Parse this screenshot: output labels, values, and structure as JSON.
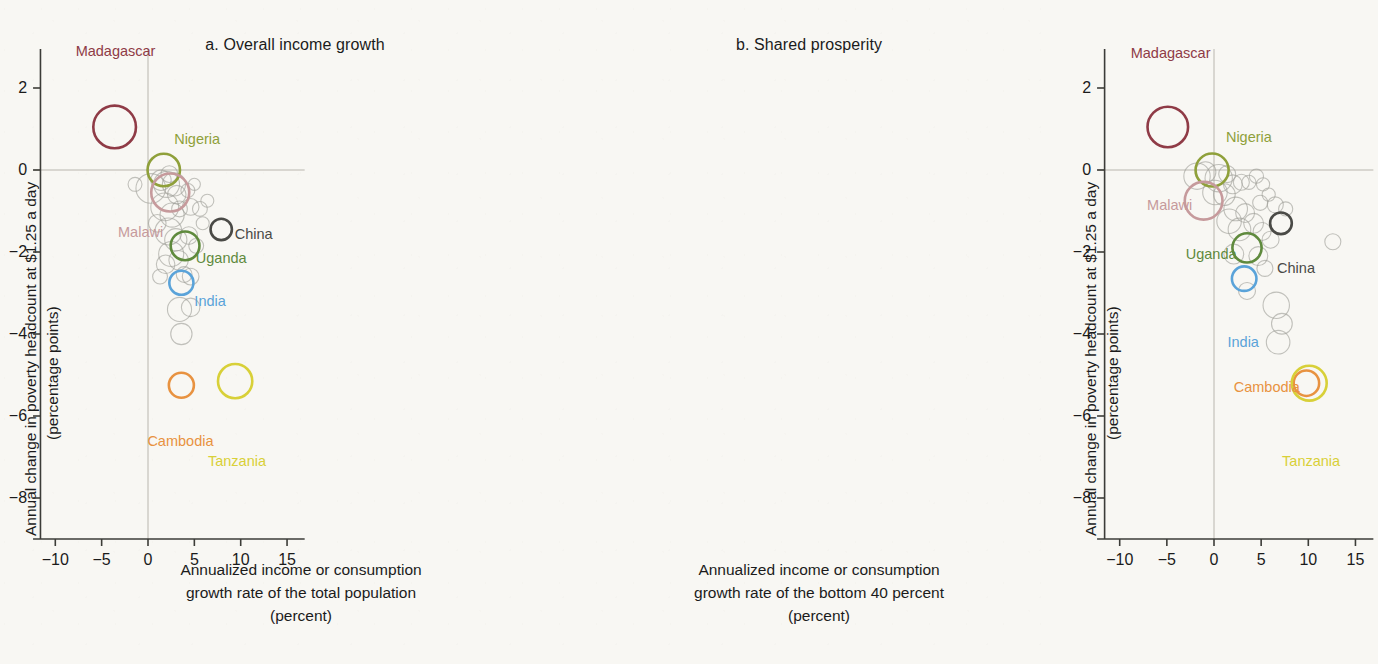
{
  "figure": {
    "background_color": "#f8f7f3",
    "ylabel_line1": "Annual change in poverty headcount at $1.25 a day",
    "ylabel_line2": "(percentage points)"
  },
  "panels": [
    {
      "key": "a",
      "title": "a. Overall income growth",
      "xlabel_line1": "Annualized income or consumption",
      "xlabel_line2": "growth rate of the total population",
      "xlabel_line3": "(percent)"
    },
    {
      "key": "b",
      "title": "b. Shared prosperity",
      "xlabel_line1": "Annualized income or consumption",
      "xlabel_line2": "growth rate of the bottom 40 percent",
      "xlabel_line3": "(percent)"
    }
  ],
  "chart_data": {
    "type": "scatter",
    "xlabel": "Annualized income or consumption growth rate (percent)",
    "ylabel": "Annual change in poverty headcount at $1.25 a day (percentage points)",
    "xlim": [
      -12.5,
      17.0
    ],
    "ylim": [
      -9.2,
      3.0
    ],
    "xticks": [
      -10,
      -5,
      0,
      5,
      10,
      15
    ],
    "xtick_labels": [
      "−10",
      "−5",
      "0",
      "5",
      "10",
      "15"
    ],
    "yticks": [
      2,
      0,
      -2,
      -4,
      -6,
      -8
    ],
    "ytick_labels": [
      "2",
      "0",
      "−2",
      "−4",
      "−6",
      "−8"
    ],
    "grid": false,
    "reference_lines": {
      "x": 0,
      "y": 0,
      "color": "#b9b6ae"
    },
    "legend": "none",
    "marker": "open circle, radius proportional to population",
    "colors": {
      "Madagascar": "#8f3b46",
      "Nigeria": "#8fa03a",
      "Malawi": "#c69a9c",
      "China": "#4a4a46",
      "Uganda": "#5f8a3d",
      "India": "#5aa3d9",
      "Cambodia": "#e89240",
      "Tanzania": "#d8d038",
      "other": "#9e9e98"
    },
    "panels": [
      {
        "key": "a",
        "title": "a. Overall income growth",
        "xlabel": "Annualized income or consumption growth rate of the total population (percent)",
        "highlighted": [
          {
            "name": "Madagascar",
            "x": -3.6,
            "y": 1.05,
            "r": 2.3,
            "label_dx": 0.1,
            "label_dy": 1.85
          },
          {
            "name": "Nigeria",
            "x": 1.7,
            "y": 0.0,
            "r": 1.75,
            "label_dx": 3.6,
            "label_dy": 0.75
          },
          {
            "name": "Malawi",
            "x": 2.4,
            "y": -0.55,
            "r": 2.05,
            "label_dx": -3.2,
            "label_dy": -0.95
          },
          {
            "name": "China",
            "x": 7.9,
            "y": -1.45,
            "r": 1.15,
            "label_dx": 3.5,
            "label_dy": -0.1
          },
          {
            "name": "Uganda",
            "x": 4.0,
            "y": -1.85,
            "r": 1.55,
            "label_dx": 3.9,
            "label_dy": -0.3
          },
          {
            "name": "India",
            "x": 3.6,
            "y": -2.75,
            "r": 1.3,
            "label_dx": 3.1,
            "label_dy": -0.45
          },
          {
            "name": "Cambodia",
            "x": 3.6,
            "y": -5.25,
            "r": 1.35,
            "label_dx": -0.1,
            "label_dy": -1.35
          },
          {
            "name": "Tanzania",
            "x": 9.4,
            "y": -5.15,
            "r": 1.85,
            "label_dx": 0.2,
            "label_dy": -1.95
          }
        ],
        "others": [
          {
            "x": -1.4,
            "y": -0.35,
            "r": 0.75
          },
          {
            "x": 0.3,
            "y": -0.45,
            "r": 1.6
          },
          {
            "x": 1.4,
            "y": -0.25,
            "r": 1.1
          },
          {
            "x": 2.0,
            "y": -0.35,
            "r": 1.4
          },
          {
            "x": 2.3,
            "y": -0.1,
            "r": 0.9
          },
          {
            "x": 2.8,
            "y": -0.35,
            "r": 1.25
          },
          {
            "x": 3.1,
            "y": -0.6,
            "r": 1.0
          },
          {
            "x": 1.8,
            "y": -0.9,
            "r": 1.5
          },
          {
            "x": 2.6,
            "y": -1.1,
            "r": 1.3
          },
          {
            "x": 3.4,
            "y": -0.95,
            "r": 0.85
          },
          {
            "x": 4.3,
            "y": -0.5,
            "r": 0.75
          },
          {
            "x": 5.0,
            "y": -0.35,
            "r": 0.65
          },
          {
            "x": 4.6,
            "y": -0.9,
            "r": 0.9
          },
          {
            "x": 5.6,
            "y": -0.95,
            "r": 0.8
          },
          {
            "x": 6.4,
            "y": -0.75,
            "r": 0.7
          },
          {
            "x": 5.9,
            "y": -1.3,
            "r": 0.7
          },
          {
            "x": 2.2,
            "y": -1.5,
            "r": 1.45
          },
          {
            "x": 3.0,
            "y": -1.7,
            "r": 1.2
          },
          {
            "x": 2.5,
            "y": -2.05,
            "r": 1.35
          },
          {
            "x": 3.3,
            "y": -2.2,
            "r": 1.05
          },
          {
            "x": 1.9,
            "y": -2.3,
            "r": 1.0
          },
          {
            "x": 4.4,
            "y": -1.6,
            "r": 0.95
          },
          {
            "x": 5.2,
            "y": -1.85,
            "r": 0.8
          },
          {
            "x": 3.9,
            "y": -2.55,
            "r": 0.85
          },
          {
            "x": 4.6,
            "y": -2.6,
            "r": 0.9
          },
          {
            "x": 3.4,
            "y": -3.4,
            "r": 1.3
          },
          {
            "x": 4.6,
            "y": -3.35,
            "r": 1.0
          },
          {
            "x": 3.6,
            "y": -4.0,
            "r": 1.15
          },
          {
            "x": 1.0,
            "y": -1.3,
            "r": 0.95
          },
          {
            "x": 1.3,
            "y": -2.6,
            "r": 0.8
          }
        ]
      },
      {
        "key": "b",
        "title": "b. Shared prosperity",
        "xlabel": "Annualized income or consumption growth rate of the bottom 40 percent (percent)",
        "highlighted": [
          {
            "name": "Madagascar",
            "x": -4.9,
            "y": 1.05,
            "r": 2.15,
            "label_dx": 0.3,
            "label_dy": 1.8
          },
          {
            "name": "Nigeria",
            "x": -0.2,
            "y": 0.0,
            "r": 1.75,
            "label_dx": 3.9,
            "label_dy": 0.8
          },
          {
            "name": "Malawi",
            "x": -1.1,
            "y": -0.75,
            "r": 2.0,
            "label_dx": -3.6,
            "label_dy": -0.1
          },
          {
            "name": "China",
            "x": 7.1,
            "y": -1.3,
            "r": 1.15,
            "label_dx": 1.6,
            "label_dy": -1.1
          },
          {
            "name": "Uganda",
            "x": 3.5,
            "y": -1.9,
            "r": 1.55,
            "label_dx": -3.8,
            "label_dy": -0.15
          },
          {
            "name": "India",
            "x": 3.2,
            "y": -2.65,
            "r": 1.3,
            "label_dx": -0.1,
            "label_dy": -1.55
          },
          {
            "name": "Cambodia",
            "x": 9.8,
            "y": -5.2,
            "r": 1.35,
            "label_dx": -4.2,
            "label_dy": -0.1
          },
          {
            "name": "Tanzania",
            "x": 10.1,
            "y": -5.2,
            "r": 1.85,
            "label_dx": 0.2,
            "label_dy": -1.9
          }
        ],
        "others": [
          {
            "x": -1.8,
            "y": -0.15,
            "r": 1.4
          },
          {
            "x": -0.9,
            "y": -0.05,
            "r": 1.1
          },
          {
            "x": 0.5,
            "y": -0.2,
            "r": 1.45
          },
          {
            "x": 1.4,
            "y": -0.1,
            "r": 0.9
          },
          {
            "x": 0.1,
            "y": -0.55,
            "r": 1.3
          },
          {
            "x": 1.1,
            "y": -0.6,
            "r": 1.15
          },
          {
            "x": 2.0,
            "y": -0.35,
            "r": 1.0
          },
          {
            "x": 2.9,
            "y": -0.3,
            "r": 0.85
          },
          {
            "x": 3.7,
            "y": -0.3,
            "r": 0.75
          },
          {
            "x": 4.5,
            "y": -0.15,
            "r": 0.75
          },
          {
            "x": 5.2,
            "y": -0.35,
            "r": 0.7
          },
          {
            "x": 4.9,
            "y": -0.8,
            "r": 0.8
          },
          {
            "x": 5.8,
            "y": -0.6,
            "r": 0.7
          },
          {
            "x": 6.5,
            "y": -0.85,
            "r": 0.85
          },
          {
            "x": 7.6,
            "y": -0.95,
            "r": 0.75
          },
          {
            "x": 2.3,
            "y": -0.95,
            "r": 1.25
          },
          {
            "x": 3.3,
            "y": -1.05,
            "r": 1.0
          },
          {
            "x": 1.6,
            "y": -1.25,
            "r": 1.3
          },
          {
            "x": 2.7,
            "y": -1.45,
            "r": 1.2
          },
          {
            "x": 4.2,
            "y": -1.3,
            "r": 1.05
          },
          {
            "x": 5.1,
            "y": -1.5,
            "r": 0.95
          },
          {
            "x": 6.0,
            "y": -1.7,
            "r": 0.9
          },
          {
            "x": 12.6,
            "y": -1.75,
            "r": 0.85
          },
          {
            "x": 2.1,
            "y": -2.05,
            "r": 1.05
          },
          {
            "x": 4.7,
            "y": -2.1,
            "r": 1.0
          },
          {
            "x": 5.4,
            "y": -2.4,
            "r": 0.85
          },
          {
            "x": 6.6,
            "y": -3.3,
            "r": 1.4
          },
          {
            "x": 7.2,
            "y": -3.75,
            "r": 1.1
          },
          {
            "x": 6.8,
            "y": -4.2,
            "r": 1.25
          },
          {
            "x": 3.5,
            "y": -2.95,
            "r": 0.9
          }
        ]
      }
    ]
  }
}
